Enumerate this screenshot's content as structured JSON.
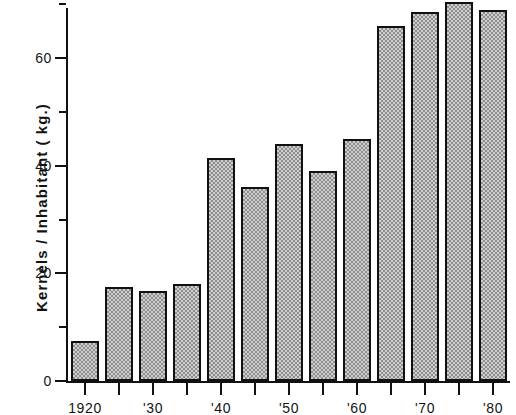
{
  "chart_data": {
    "type": "bar",
    "title": "",
    "subtitle": "",
    "xlabel": "",
    "ylabel": "Kernels / Inhabitant ( kg.)",
    "categories": [
      "1920",
      "1925",
      "1930",
      "1935",
      "1940",
      "1945",
      "1950",
      "1955",
      "1960",
      "1965",
      "1970",
      "1975",
      "1980"
    ],
    "tick_labels_x": [
      "1920",
      "",
      "'30",
      "",
      "'40",
      "",
      "'50",
      "",
      "'60",
      "",
      "'70",
      "",
      "'80"
    ],
    "values": [
      7.5,
      17.5,
      16.8,
      18.0,
      41.5,
      36.0,
      44.0,
      39.0,
      45.0,
      66.0,
      68.5,
      70.5,
      69.0
    ],
    "ylim": [
      0,
      74
    ],
    "xlim_note": "bars span 1920 through 1980 at 5-year intervals",
    "y_ticks_major": [
      0,
      20,
      40,
      60
    ],
    "y_ticks_minor": [
      10,
      30,
      50,
      70
    ],
    "y_tick_labels": [
      "0",
      "20",
      "40",
      "60"
    ],
    "grid": false,
    "legend": false,
    "legend_position": "none",
    "bar_fill_color": "#a8a8a8",
    "bar_edge_color": "#101010",
    "background_color": "#ffffff",
    "axis_color": "#111111"
  },
  "axes": {
    "y_axis_title": "Kernels / Inhabitant ( kg.)",
    "y_labels": [
      {
        "value": 60,
        "text": "60"
      },
      {
        "value": 40,
        "text": "40"
      },
      {
        "value": 20,
        "text": "20"
      },
      {
        "value": 0,
        "text": "0"
      }
    ],
    "x_labels": [
      {
        "category": "1920",
        "text": "1920"
      },
      {
        "category": "1930",
        "text": "'30"
      },
      {
        "category": "1940",
        "text": "'40"
      },
      {
        "category": "1950",
        "text": "'50"
      },
      {
        "category": "1960",
        "text": "'60"
      },
      {
        "category": "1970",
        "text": "'70"
      },
      {
        "category": "1980",
        "text": "'80"
      }
    ]
  }
}
